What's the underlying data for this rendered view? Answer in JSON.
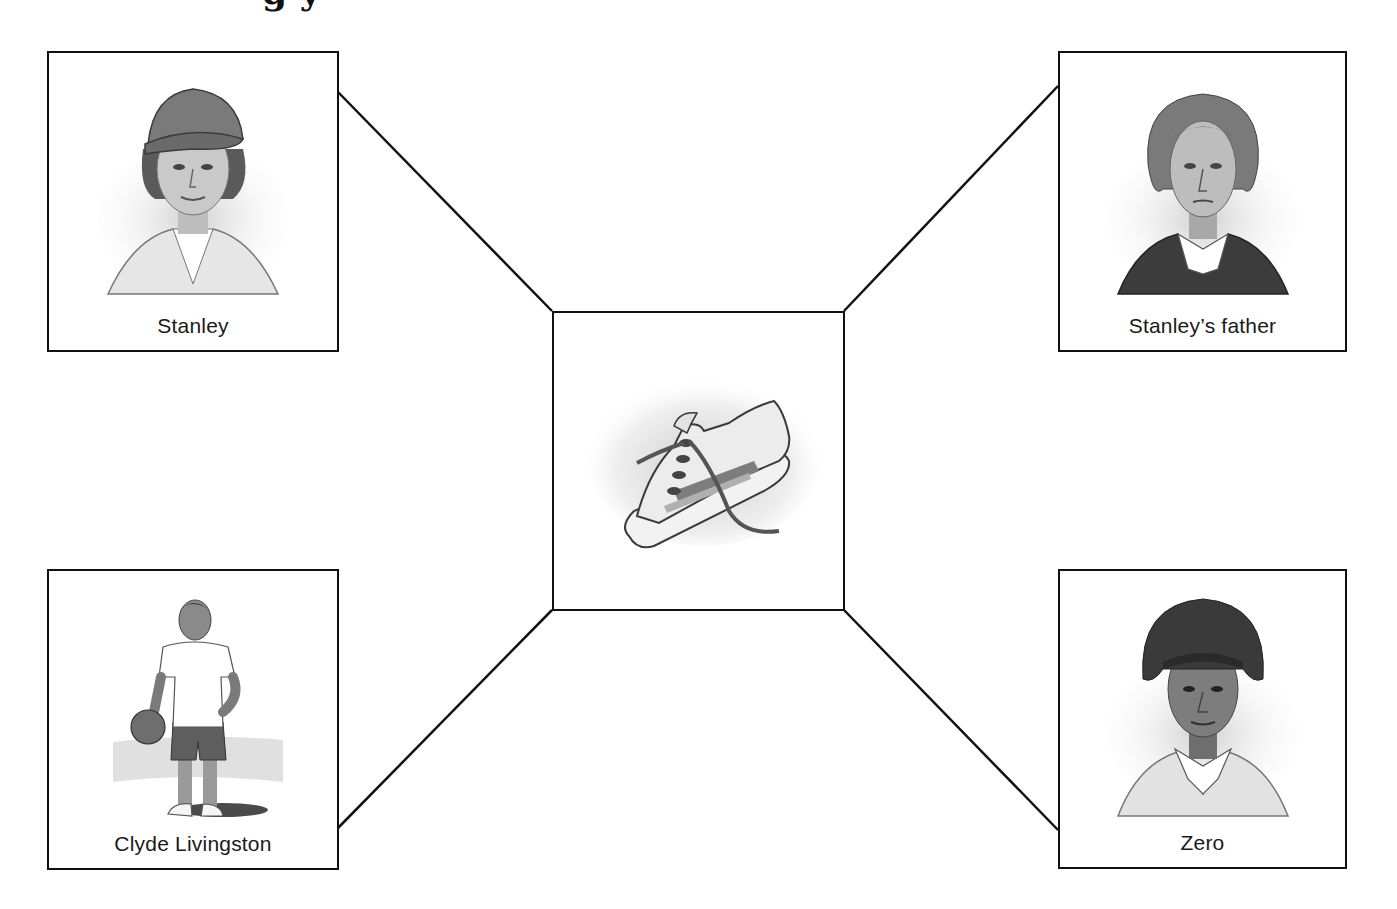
{
  "heading": {
    "visible_fragment": "g                                  y",
    "note_clipped": true
  },
  "center": {
    "label": "",
    "icon": "sneaker-illustration"
  },
  "characters": [
    {
      "id": "stanley",
      "label": "Stanley",
      "icon": "stanley-portrait"
    },
    {
      "id": "stanleys-father",
      "label": "Stanley’s father",
      "icon": "stanleys-father-portrait"
    },
    {
      "id": "clyde-livingston",
      "label": "Clyde Livingston",
      "icon": "clyde-livingston-portrait"
    },
    {
      "id": "zero",
      "label": "Zero",
      "icon": "zero-portrait"
    }
  ],
  "colors": {
    "line": "#111111",
    "background": "#ffffff",
    "sketch_dark": "#3a3a3a",
    "sketch_mid": "#8a8a8a",
    "sketch_light": "#d6d6d6"
  }
}
